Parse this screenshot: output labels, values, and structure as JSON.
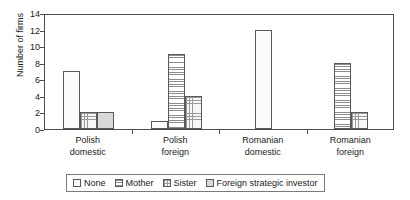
{
  "chart_data": {
    "type": "bar",
    "title": "",
    "subtitle": "",
    "xlabel": "",
    "ylabel": "Number of firms",
    "ylim": [
      0,
      14
    ],
    "ytick_step": 2,
    "yticks": [
      "0",
      "2",
      "4",
      "6",
      "8",
      "10",
      "12",
      "14"
    ],
    "grid": false,
    "legend_position": "bottom-center",
    "categories": [
      "Polish domestic",
      "Polish foreign",
      "Romanian domestic",
      "Romanian foreign"
    ],
    "category_lines": [
      [
        "Polish",
        "domestic"
      ],
      [
        "Polish",
        "foreign"
      ],
      [
        "Romanian",
        "domestic"
      ],
      [
        "Romanian",
        "foreign"
      ]
    ],
    "series": [
      {
        "name": "None",
        "pattern": "dotted",
        "values": [
          7,
          1,
          12,
          0
        ]
      },
      {
        "name": "Mother",
        "pattern": "horizontal-lines",
        "values": [
          0,
          9,
          0,
          8
        ]
      },
      {
        "name": "Sister",
        "pattern": "cross-hatch-dots",
        "values": [
          2,
          4,
          0,
          2
        ]
      },
      {
        "name": "Foreign strategic investor",
        "pattern": "solid-gray",
        "values": [
          2,
          0,
          0,
          0
        ]
      }
    ]
  },
  "legend": {
    "items": [
      {
        "label": "None"
      },
      {
        "label": "Mother"
      },
      {
        "label": "Sister"
      },
      {
        "label": "Foreign strategic investor"
      }
    ]
  },
  "colors": {
    "axis": "#4d4d4d",
    "bar_outline": "#595959",
    "background": "#ffffff",
    "text": "#1a1a1a"
  }
}
